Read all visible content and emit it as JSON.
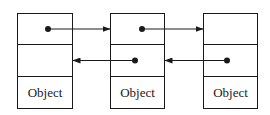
{
  "diagram": {
    "type": "doubly-linked-list",
    "colors": {
      "stroke": "#1a1a1a",
      "background": "#ffffff"
    },
    "nodes": [
      {
        "id": "node-1",
        "label": "Object"
      },
      {
        "id": "node-2",
        "label": "Object"
      },
      {
        "id": "node-3",
        "label": "Object"
      }
    ],
    "edges": [
      {
        "from": "node-1",
        "to": "node-2",
        "kind": "next"
      },
      {
        "from": "node-2",
        "to": "node-3",
        "kind": "next"
      },
      {
        "from": "node-2",
        "to": "node-1",
        "kind": "prev"
      },
      {
        "from": "node-3",
        "to": "node-2",
        "kind": "prev"
      }
    ]
  }
}
